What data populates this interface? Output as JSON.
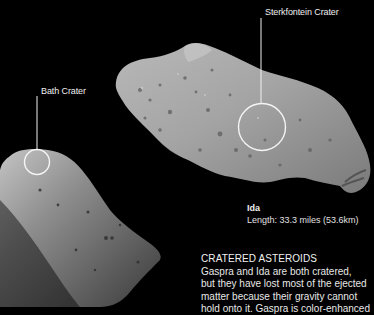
{
  "image": {
    "description": "Spacecraft images of two cratered asteroids, Gaspra (lower left) and Ida (upper right), on a black background with annotated craters",
    "background_color": "#000000"
  },
  "annotations": {
    "bath_crater": {
      "label": "Bath Crater"
    },
    "sterkfontein_crater": {
      "label": "Sterkfontein Crater"
    }
  },
  "ida_caption": {
    "name": "Ida",
    "length": "Length: 33.3 miles (53.6km)"
  },
  "info": {
    "title": "CRATERED ASTEROIDS",
    "lines": [
      "Gaspra and Ida are both cratered,",
      "but they have lost most of the ejected",
      "matter because their gravity cannot",
      "hold onto it. Gaspra is color-enhanced"
    ]
  }
}
